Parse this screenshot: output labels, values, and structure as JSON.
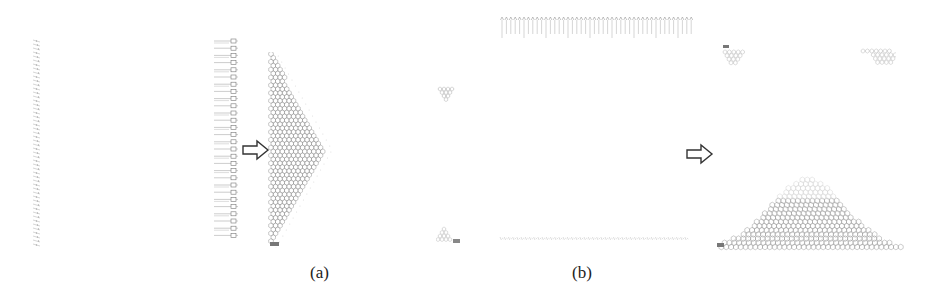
{
  "figure": {
    "panels": [
      {
        "id": "a",
        "caption": "(a)",
        "description": "Vertical column of stacked circuit elements transformed into a right-pointing triangular hexagonal lattice",
        "corner_labels": [
          "dw",
          "sw"
        ]
      },
      {
        "id": "b",
        "caption": "(b)",
        "description": "Horizontal rows of circuit elements transformed into a bell-shaped hexagonal lattice",
        "corner_labels": [
          "sw",
          "sw"
        ]
      }
    ],
    "arrows": [
      {
        "name": "transform-arrow-a",
        "direction": "right"
      },
      {
        "name": "transform-arrow-b",
        "direction": "right"
      }
    ],
    "colors": {
      "line": "#9a9a9a",
      "dark_line": "#333333",
      "background": "#ffffff"
    }
  }
}
